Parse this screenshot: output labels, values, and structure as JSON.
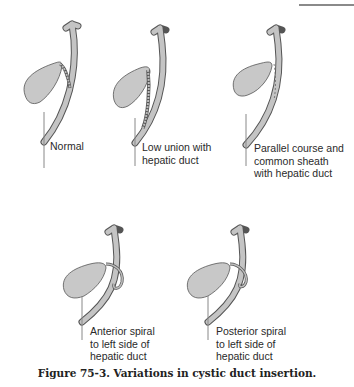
{
  "figure": {
    "caption": "Figure 75-3.  Variations in cystic duct insertion.",
    "panels": [
      {
        "id": "normal",
        "label": "Normal"
      },
      {
        "id": "low-union",
        "label": "Low union with\nhepatic duct"
      },
      {
        "id": "parallel-course",
        "label": "Parallel course and\ncommon sheath\nwith hepatic duct"
      },
      {
        "id": "anterior-spiral",
        "label": "Anterior spiral\nto left side of\nhepatic duct"
      },
      {
        "id": "posterior-spiral",
        "label": "Posterior spiral\nto left side of\nhepatic duct"
      }
    ],
    "colors": {
      "organ_fill": "#c8c8c8",
      "organ_stroke": "#555555",
      "duct_fill": "#bdbdbd"
    }
  }
}
